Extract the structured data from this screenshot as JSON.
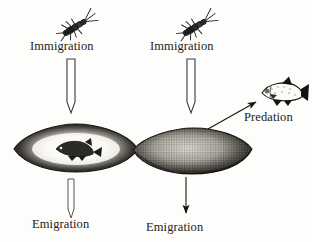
{
  "figure": {
    "type": "scientific-diagram",
    "background_color": "#fdfdfb",
    "ink_color": "#1b1b1b"
  },
  "panels": [
    {
      "id": "left-panel",
      "description": "substrate stone with fish present",
      "immigration_label": "Immigration",
      "emigration_label": "Emigration",
      "immigration_arrow": "hollow-down-arrow",
      "emigration_arrow": "hollow-down-arrow",
      "insect_icon": "mayfly-nymph-icon",
      "stone_icon": "stone-with-fish-icon",
      "has_predation": false
    },
    {
      "id": "right-panel",
      "description": "substrate stone without fish, predation by external fish",
      "immigration_label": "Immigration",
      "emigration_label": "Emigration",
      "immigration_arrow": "hollow-down-arrow",
      "emigration_arrow": "thin-line-down-arrow",
      "insect_icon": "mayfly-nymph-icon",
      "stone_icon": "stippled-stone-icon",
      "has_predation": true,
      "predation_label": "Predation",
      "predation_arrow": "thin-line-diagonal-arrow",
      "predator_icon": "fish-icon"
    }
  ]
}
